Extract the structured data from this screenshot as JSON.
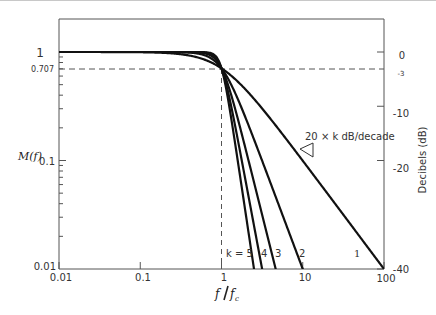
{
  "chart_data": {
    "type": "line",
    "title": "",
    "xlabel": "f / fc",
    "ylabel": "M(f)",
    "ylabel_right": "Decibels (dB)",
    "xscale": "log",
    "yscale": "log",
    "xlim": [
      0.01,
      100
    ],
    "ylim": [
      0.01,
      1.3
    ],
    "x_ticks": [
      "0.01",
      "0.1",
      "1",
      "10",
      "100"
    ],
    "y_ticks": [
      "0.01",
      "0.1",
      "1"
    ],
    "y_ticks_extra": [
      "0.707"
    ],
    "y_right_ticks": [
      "0",
      "-3",
      "-10",
      "-20",
      "-40"
    ],
    "grid": false,
    "reference_lines": [
      {
        "type": "horizontal",
        "y": 0.707,
        "style": "dashed",
        "label": "0.707 / -3 dB"
      },
      {
        "type": "vertical",
        "x": 1,
        "style": "dashed"
      }
    ],
    "annotation": "20 × k dB/decade",
    "series_labels_prefix": "k = ",
    "series": [
      {
        "name": "k = 1",
        "label": "1",
        "order": 1,
        "x": [
          0.01,
          0.1,
          0.5,
          1,
          2,
          10,
          100
        ],
        "values": [
          1.0,
          0.995,
          0.894,
          0.707,
          0.447,
          0.0995,
          0.01
        ]
      },
      {
        "name": "k = 2",
        "label": "2",
        "order": 2,
        "x": [
          0.01,
          0.1,
          0.5,
          1,
          2,
          5,
          10
        ],
        "values": [
          1.0,
          1.0,
          0.97,
          0.707,
          0.243,
          0.04,
          0.01
        ]
      },
      {
        "name": "k = 3",
        "label": "3",
        "order": 3,
        "x": [
          0.01,
          0.1,
          0.5,
          1,
          2,
          4.64
        ],
        "values": [
          1.0,
          1.0,
          0.992,
          0.707,
          0.124,
          0.01
        ]
      },
      {
        "name": "k = 4",
        "label": "4",
        "order": 4,
        "x": [
          0.01,
          0.1,
          0.5,
          1,
          2,
          3.16
        ],
        "values": [
          1.0,
          1.0,
          0.998,
          0.707,
          0.062,
          0.01
        ]
      },
      {
        "name": "k = 5",
        "label": "5",
        "order": 5,
        "x": [
          0.01,
          0.1,
          0.5,
          1,
          2,
          2.51
        ],
        "values": [
          1.0,
          1.0,
          0.9995,
          0.707,
          0.031,
          0.01
        ]
      }
    ]
  },
  "axes": {
    "left_label": "M(f)",
    "right_label": "Decibels (dB)",
    "x_label_num": "f",
    "x_label_den": "f",
    "x_label_den_sub": "c",
    "x_ticks": [
      {
        "label": "0.01",
        "value": 0.01
      },
      {
        "label": "0.1",
        "value": 0.1
      },
      {
        "label": "1",
        "value": 1
      },
      {
        "label": "10",
        "value": 10
      },
      {
        "label": "100",
        "value": 100
      }
    ],
    "y_ticks": [
      {
        "label": "1",
        "value": 1
      },
      {
        "label": "0.707",
        "value": 0.707
      },
      {
        "label": "0.1",
        "value": 0.1
      },
      {
        "label": "0.01",
        "value": 0.01
      }
    ],
    "db_ticks": [
      {
        "label": "0",
        "db": 0
      },
      {
        "label": "-3",
        "db": -3
      },
      {
        "label": "-10",
        "db": -10
      },
      {
        "label": "-20",
        "db": -20
      },
      {
        "label": "-40",
        "db": -40
      }
    ]
  },
  "annotations": {
    "slope_text": "20 × k dB/decade",
    "k_label": "k = 5",
    "curve_labels": [
      "4",
      "3",
      "2",
      "1"
    ]
  }
}
